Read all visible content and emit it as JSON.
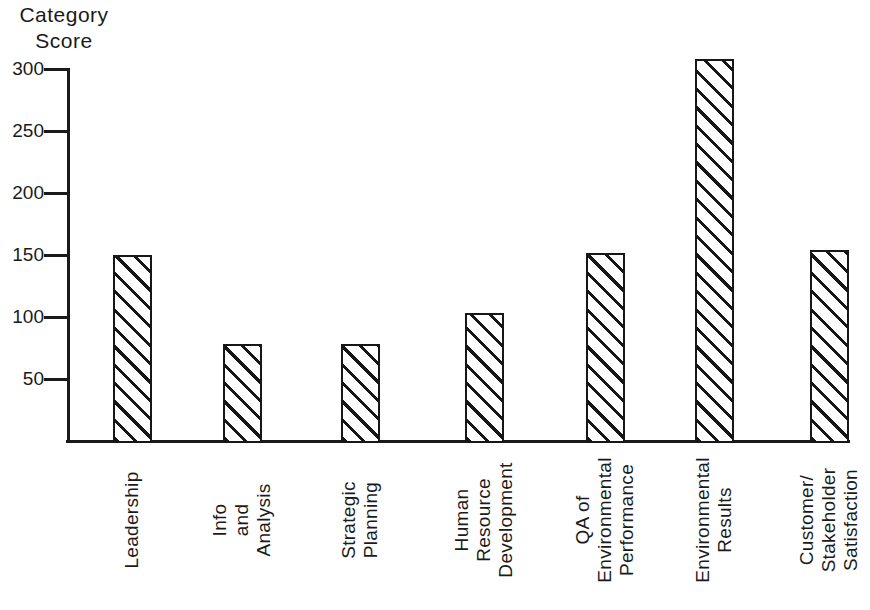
{
  "chart_data": {
    "type": "bar",
    "title": "",
    "ylabel": "Category Score",
    "ylabel_lines": [
      "Category",
      "Score"
    ],
    "xlabel": "",
    "categories": [
      "Leadership",
      "Info and Analysis",
      "Strategic Planning",
      "Human Resource Development",
      "QA of Environmental Performance",
      "Environmental Results",
      "Customer/ Stakeholder Satisfaction"
    ],
    "categories_lines": [
      [
        "Leadership"
      ],
      [
        "Info",
        "and",
        "Analysis"
      ],
      [
        "Strategic",
        "Planning"
      ],
      [
        "Human",
        "Resource",
        "Development"
      ],
      [
        "QA of",
        "Environmental",
        "Performance"
      ],
      [
        "Environmental",
        "Results"
      ],
      [
        "Customer/",
        "Stakeholder",
        "Satisfaction"
      ]
    ],
    "values": [
      150,
      78,
      78,
      103,
      152,
      308,
      154
    ],
    "yticks": [
      50,
      100,
      150,
      200,
      250,
      300
    ],
    "ylim": [
      0,
      300
    ],
    "grid": false,
    "legend": "none",
    "bar_fill": "black-diagonal-hatch-on-white",
    "ink_color": "#1a1a1a",
    "background_color": "#ffffff"
  }
}
